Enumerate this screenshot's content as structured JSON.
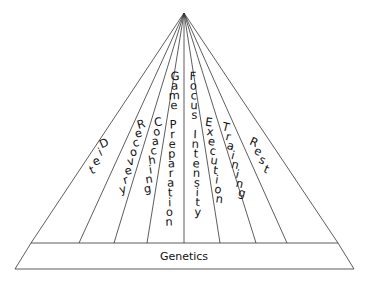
{
  "diagram": {
    "title": "",
    "base": {
      "label": "Genetics"
    },
    "segments": [
      {
        "label": "Diet"
      },
      {
        "label": "Recovery"
      },
      {
        "label": "Coaching"
      },
      {
        "label": "Game Preparation"
      },
      {
        "label": "Focus Intensity"
      },
      {
        "label": "Execution"
      },
      {
        "label": "Training"
      },
      {
        "label": "Rest"
      }
    ],
    "colors": {
      "stroke": "#333333",
      "text": "#111111",
      "background": "#ffffff"
    }
  }
}
